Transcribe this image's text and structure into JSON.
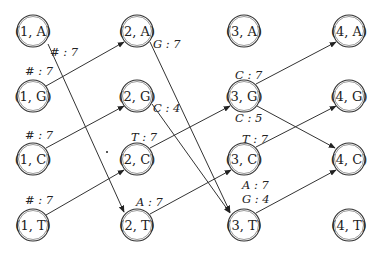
{
  "diagram": {
    "type": "graph",
    "columns": [
      1,
      2,
      3,
      4
    ],
    "rows": [
      "A",
      "G",
      "C",
      "T"
    ],
    "nodes": [
      {
        "id": "1A",
        "label": "(1, A)",
        "col": 1,
        "row": "A"
      },
      {
        "id": "1G",
        "label": "(1, G)",
        "col": 1,
        "row": "G"
      },
      {
        "id": "1C",
        "label": "(1, C)",
        "col": 1,
        "row": "C"
      },
      {
        "id": "1T",
        "label": "(1, T)",
        "col": 1,
        "row": "T"
      },
      {
        "id": "2A",
        "label": "(2, A)",
        "col": 2,
        "row": "A"
      },
      {
        "id": "2G",
        "label": "(2, G)",
        "col": 2,
        "row": "G"
      },
      {
        "id": "2C",
        "label": "(2, C)",
        "col": 2,
        "row": "C"
      },
      {
        "id": "2T",
        "label": "(2, T)",
        "col": 2,
        "row": "T"
      },
      {
        "id": "3A",
        "label": "(3, A)",
        "col": 3,
        "row": "A"
      },
      {
        "id": "3G",
        "label": "(3, G)",
        "col": 3,
        "row": "G"
      },
      {
        "id": "3C",
        "label": "(3, C)",
        "col": 3,
        "row": "C"
      },
      {
        "id": "3T",
        "label": "(3, T)",
        "col": 3,
        "row": "T"
      },
      {
        "id": "4A",
        "label": "(4, A)",
        "col": 4,
        "row": "A"
      },
      {
        "id": "4G",
        "label": "(4, G)",
        "col": 4,
        "row": "G"
      },
      {
        "id": "4C",
        "label": "(4, C)",
        "col": 4,
        "row": "C"
      },
      {
        "id": "4T",
        "label": "(4, T)",
        "col": 4,
        "row": "T"
      }
    ],
    "edges": [
      {
        "from": "1A",
        "to": "2T",
        "label": "# : 7"
      },
      {
        "from": "1G",
        "to": "2A",
        "label": "# : 7"
      },
      {
        "from": "1C",
        "to": "2G",
        "label": "# : 7"
      },
      {
        "from": "1T",
        "to": "2C",
        "label": "# : 7"
      },
      {
        "from": "2A",
        "to": "3T",
        "label": "G : 7"
      },
      {
        "from": "2G",
        "to": "3T",
        "label": "C : 4"
      },
      {
        "from": "2C",
        "to": "3G",
        "label": "T : 7"
      },
      {
        "from": "2T",
        "to": "3C",
        "label": "A : 7"
      },
      {
        "from": "3G",
        "to": "4A",
        "label": "C : 7"
      },
      {
        "from": "3G",
        "to": "4C",
        "label": "C : 5"
      },
      {
        "from": "3C",
        "to": "4G",
        "label": "T : 7"
      },
      {
        "from": "3T",
        "to": "4C",
        "label": "A : 7",
        "label2": "G : 4"
      }
    ]
  },
  "text": {
    "n1A": "(1, A)",
    "n1G": "(1, G)",
    "n1C": "(1, C)",
    "n1T": "(1, T)",
    "n2A": "(2, A)",
    "n2G": "(2, G)",
    "n2C": "(2, C)",
    "n2T": "(2, T)",
    "n3A": "(3, A)",
    "n3G": "(3, G)",
    "n3C": "(3, C)",
    "n3T": "(3, T)",
    "n4A": "(4, A)",
    "n4G": "(4, G)",
    "n4C": "(4, C)",
    "n4T": "(4, T)",
    "e_1A_2T": "# : 7",
    "e_1G_2A": "# : 7",
    "e_1C_2G": "# : 7",
    "e_1T_2C": "# : 7",
    "e_2A_3T": "G : 7",
    "e_2G_3T": "C : 4",
    "e_2C_3G": "T : 7",
    "e_2T_3C": "A : 7",
    "e_3G_4A": "C : 7",
    "e_3G_4C": "C : 5",
    "e_3C_4G": "T : 7",
    "e_3T_4C_a": "A : 7",
    "e_3T_4C_b": "G : 4"
  }
}
